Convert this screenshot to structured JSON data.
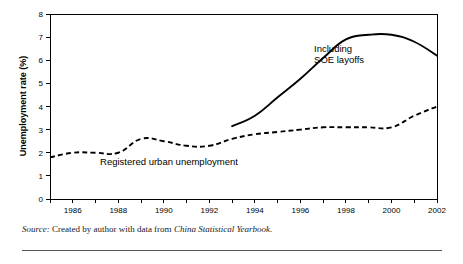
{
  "figure": {
    "source_note": {
      "label": "Source:",
      "text_before": " Created by author with data from ",
      "italic_work": "China Statistical Yearbook",
      "text_after": "."
    }
  },
  "chart_data": {
    "type": "line",
    "title": "",
    "xlabel": "",
    "ylabel": "Unemployment rate (%)",
    "xlim": [
      1985,
      2002
    ],
    "ylim": [
      0,
      8
    ],
    "yticks": [
      0,
      1,
      2,
      3,
      4,
      5,
      6,
      7,
      8
    ],
    "ytick_labels": [
      "0",
      "1",
      "2",
      "3",
      "4",
      "5",
      "6",
      "7",
      "8"
    ],
    "xticks": [
      1985,
      1986,
      1987,
      1988,
      1989,
      1990,
      1991,
      1992,
      1993,
      1994,
      1995,
      1996,
      1997,
      1998,
      1999,
      2000,
      2001,
      2002
    ],
    "xtick_labels": [
      "",
      "1986",
      "",
      "1988",
      "",
      "1990",
      "",
      "1992",
      "",
      "1994",
      "",
      "1996",
      "",
      "1998",
      "",
      "2000",
      "",
      "2002"
    ],
    "grid": false,
    "legend_position": "inline-annotation",
    "series": [
      {
        "name": "Registered urban unemployment",
        "style": "dashed",
        "x": [
          1985,
          1986,
          1987,
          1988,
          1989,
          1990,
          1991,
          1992,
          1993,
          1994,
          1995,
          1996,
          1997,
          1998,
          1999,
          2000,
          2001,
          2002
        ],
        "values": [
          1.8,
          2.0,
          2.0,
          2.0,
          2.6,
          2.5,
          2.3,
          2.3,
          2.6,
          2.8,
          2.9,
          3.0,
          3.1,
          3.1,
          3.1,
          3.1,
          3.6,
          4.0
        ],
        "annotation": "Registered urban unemployment",
        "annotation_x": 1987.2,
        "annotation_y": 1.45
      },
      {
        "name": "Including SOE layoffs",
        "style": "solid",
        "x": [
          1993,
          1994,
          1995,
          1996,
          1997,
          1998,
          1999,
          2000,
          2001,
          2002
        ],
        "values": [
          3.15,
          3.6,
          4.4,
          5.2,
          6.1,
          6.9,
          7.1,
          7.1,
          6.8,
          6.2
        ],
        "annotation_line1": "Including",
        "annotation_line2": "SOE layoffs",
        "annotation_x": 1996.6,
        "annotation_y": 6.35
      }
    ]
  }
}
